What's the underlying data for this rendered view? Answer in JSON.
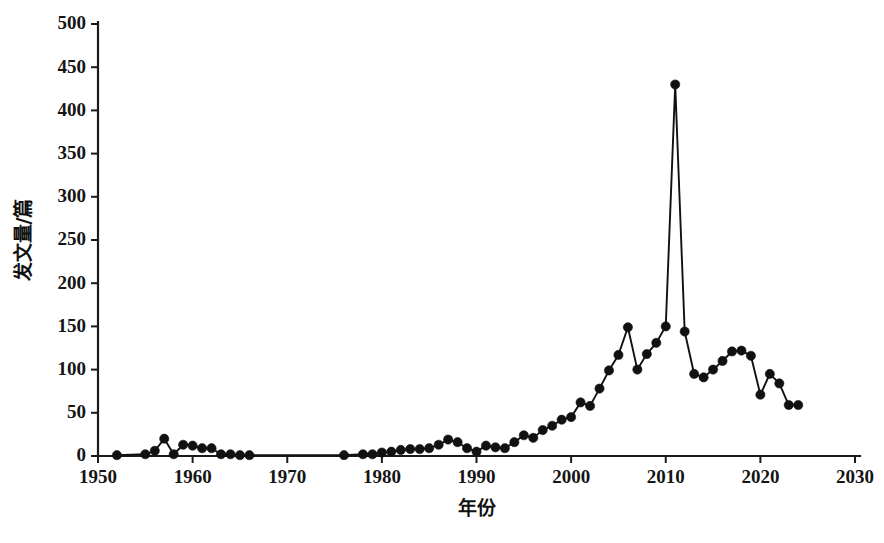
{
  "chart_data": {
    "type": "line",
    "title": "",
    "xlabel": "年份",
    "ylabel": "发文量/篇",
    "xlim": [
      1950,
      2030
    ],
    "ylim": [
      0,
      500
    ],
    "xticks": [
      1950,
      1960,
      1970,
      1980,
      1990,
      2000,
      2010,
      2020,
      2030
    ],
    "yticks": [
      0,
      50,
      100,
      150,
      200,
      250,
      300,
      350,
      400,
      450,
      500
    ],
    "grid": false,
    "legend": null,
    "marker": "filled-circle",
    "series": [
      {
        "name": "发文量",
        "x": [
          1952,
          1955,
          1956,
          1957,
          1958,
          1959,
          1960,
          1961,
          1962,
          1963,
          1964,
          1965,
          1966,
          1976,
          1978,
          1979,
          1980,
          1981,
          1982,
          1983,
          1984,
          1985,
          1986,
          1987,
          1988,
          1989,
          1990,
          1991,
          1992,
          1993,
          1994,
          1995,
          1996,
          1997,
          1998,
          1999,
          2000,
          2001,
          2002,
          2003,
          2004,
          2005,
          2006,
          2007,
          2008,
          2009,
          2010,
          2011,
          2012,
          2013,
          2014,
          2015,
          2016,
          2017,
          2018,
          2019,
          2020,
          2021,
          2022,
          2023,
          2024
        ],
        "values": [
          1,
          2,
          6,
          20,
          2,
          13,
          12,
          9,
          9,
          2,
          2,
          1,
          1,
          1,
          2,
          2,
          4,
          5,
          7,
          8,
          8,
          9,
          13,
          19,
          16,
          9,
          5,
          12,
          10,
          9,
          16,
          24,
          21,
          30,
          35,
          42,
          45,
          62,
          58,
          78,
          99,
          117,
          149,
          100,
          118,
          131,
          150,
          430,
          144,
          95,
          91,
          100,
          110,
          121,
          122,
          116,
          71,
          95,
          84,
          59,
          59
        ]
      }
    ]
  },
  "axes": {
    "y_axis_name": "y-axis",
    "x_axis_name": "x-axis"
  }
}
